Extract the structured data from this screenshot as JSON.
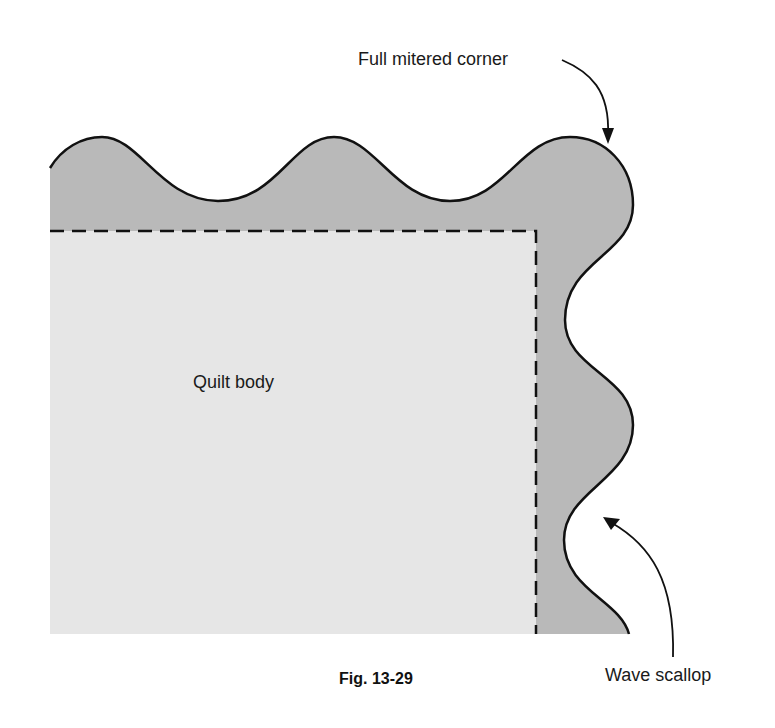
{
  "figure": {
    "caption": "Fig. 13-29",
    "colors": {
      "border_fill": "#b9b9b9",
      "body_fill": "#e6e6e6",
      "outline": "#111111",
      "background": "#ffffff"
    }
  },
  "labels": {
    "corner": "Full mitered corner",
    "body": "Quilt body",
    "scallop": "Wave scallop"
  }
}
